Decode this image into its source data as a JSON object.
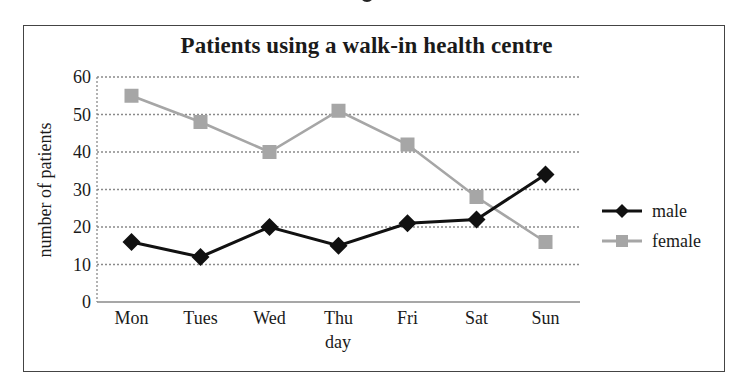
{
  "chart_data": {
    "type": "line",
    "title": "Patients using a walk-in health centre",
    "xlabel": "day",
    "ylabel": "number of patients",
    "categories": [
      "Mon",
      "Tues",
      "Wed",
      "Thu",
      "Fri",
      "Sat",
      "Sun"
    ],
    "series": [
      {
        "name": "male",
        "color": "#111111",
        "marker": "diamond",
        "values": [
          16,
          12,
          20,
          15,
          21,
          22,
          34
        ]
      },
      {
        "name": "female",
        "color": "#a6a6a6",
        "marker": "square",
        "values": [
          55,
          48,
          40,
          51,
          42,
          28,
          16
        ]
      }
    ],
    "ylim": [
      0,
      60
    ],
    "yticks": [
      0,
      10,
      20,
      30,
      40,
      50,
      60
    ],
    "grid": "horizontal dotted",
    "legend_position": "right"
  },
  "legend": {
    "items": [
      {
        "label": "male"
      },
      {
        "label": "female"
      }
    ]
  }
}
